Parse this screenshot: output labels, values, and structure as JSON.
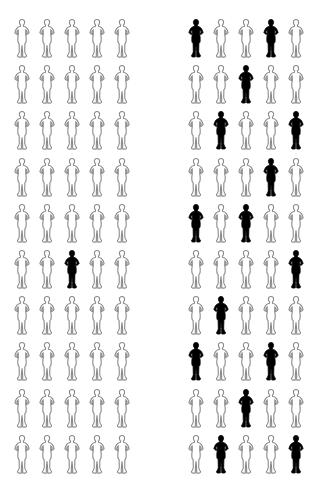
{
  "chart_data": {
    "type": "icon_array",
    "title": "",
    "panels": [
      {
        "name": "left",
        "rows": 10,
        "cols": 5,
        "total": 50,
        "highlighted_count": 1,
        "grid": [
          [
            0,
            0,
            0,
            0,
            0
          ],
          [
            0,
            0,
            0,
            0,
            0
          ],
          [
            0,
            0,
            0,
            0,
            0
          ],
          [
            0,
            0,
            0,
            0,
            0
          ],
          [
            0,
            0,
            0,
            0,
            0
          ],
          [
            0,
            0,
            1,
            0,
            0
          ],
          [
            0,
            0,
            0,
            0,
            0
          ],
          [
            0,
            0,
            0,
            0,
            0
          ],
          [
            0,
            0,
            0,
            0,
            0
          ],
          [
            0,
            0,
            0,
            0,
            0
          ]
        ]
      },
      {
        "name": "right",
        "rows": 10,
        "cols": 5,
        "total": 50,
        "highlighted_count": 15,
        "grid": [
          [
            1,
            0,
            0,
            1,
            0
          ],
          [
            0,
            0,
            1,
            0,
            0
          ],
          [
            0,
            1,
            0,
            0,
            1
          ],
          [
            0,
            0,
            0,
            1,
            0
          ],
          [
            1,
            0,
            1,
            0,
            0
          ],
          [
            0,
            0,
            0,
            0,
            1
          ],
          [
            0,
            1,
            0,
            0,
            0
          ],
          [
            1,
            0,
            0,
            1,
            0
          ],
          [
            0,
            0,
            1,
            0,
            0
          ],
          [
            0,
            1,
            0,
            0,
            1
          ]
        ]
      }
    ],
    "icon": "person-figure-icon",
    "colors": {
      "highlighted": "#000000",
      "outline": "#8a8a8a",
      "background": "#ffffff"
    }
  }
}
